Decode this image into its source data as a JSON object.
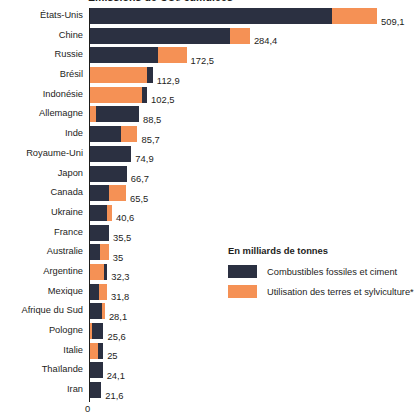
{
  "chart_data": {
    "type": "bar",
    "orientation": "horizontal",
    "stacked": true,
    "title": "Émissions de CO₂ cumulées",
    "subtitle": "",
    "xlabel": "",
    "ylabel": "",
    "unit_label": "En milliards de tonnes",
    "axis_zero_label": "0",
    "xlim": [
      0,
      509.1
    ],
    "grid": false,
    "legend_position": "center-right",
    "categories": [
      "États-Unis",
      "Chine",
      "Russie",
      "Brésil",
      "Indonésie",
      "Allemagne",
      "Inde",
      "Royaume-Uni",
      "Japon",
      "Canada",
      "Ukraine",
      "France",
      "Australie",
      "Argentine",
      "Mexique",
      "Afrique du Sud",
      "Pologne",
      "Italie",
      "Thaïlande",
      "Iran"
    ],
    "series": [
      {
        "name": "Combustibles fossiles et ciment",
        "color": "#2b3041",
        "values": [
          429.1,
          249.4,
          121.5,
          10.9,
          9.5,
          75.5,
          56.7,
          74.9,
          66.7,
          35.5,
          31.6,
          35.5,
          20.0,
          5.3,
          17.8,
          22.1,
          20.6,
          9.0,
          24.1,
          21.6
        ]
      },
      {
        "name": "Utilisation des terres et sylviculture*",
        "color": "#f59155",
        "values": [
          80.0,
          35.0,
          51.0,
          102.0,
          93.0,
          13.0,
          29.0,
          0.0,
          0.0,
          30.0,
          9.0,
          0.0,
          15.0,
          27.0,
          14.0,
          6.0,
          5.0,
          16.0,
          0.0,
          0.0
        ]
      }
    ],
    "totals": [
      509.1,
      284.4,
      172.5,
      112.9,
      102.5,
      88.5,
      85.7,
      74.9,
      66.7,
      65.5,
      40.6,
      35.5,
      35.0,
      32.3,
      31.8,
      28.1,
      25.6,
      25.0,
      24.1,
      21.6
    ],
    "total_labels": [
      "509,1",
      "284,4",
      "172,5",
      "112,9",
      "102,5",
      "88,5",
      "85,7",
      "74,9",
      "66,7",
      "65,5",
      "40,6",
      "35,5",
      "35",
      "32,3",
      "31,8",
      "28,1",
      "25,6",
      "25",
      "24,1",
      "21,6"
    ],
    "land_first": [
      false,
      false,
      false,
      true,
      true,
      true,
      false,
      false,
      false,
      false,
      false,
      false,
      false,
      true,
      false,
      false,
      true,
      true,
      false,
      false
    ]
  },
  "legend": {
    "title": "En milliards de tonnes",
    "items": [
      {
        "label": "Combustibles fossiles et ciment",
        "color": "#2b3041"
      },
      {
        "label": "Utilisation des terres et sylviculture*",
        "color": "#f59155"
      }
    ]
  },
  "colors": {
    "fossil": "#2b3041",
    "land": "#f59155",
    "text": "#1d1d1b",
    "background": "#ffffff"
  }
}
